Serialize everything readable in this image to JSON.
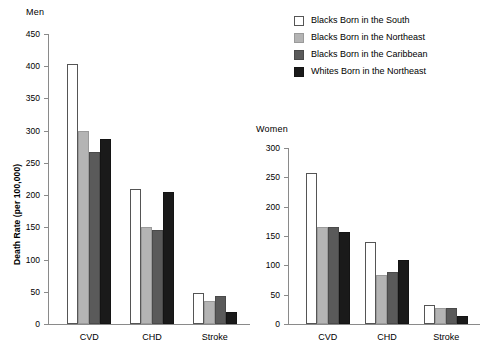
{
  "legend": {
    "position": "top-right",
    "items": [
      {
        "label": "Blacks Born in the South",
        "color": "#ffffff",
        "series_key": "blacks_south"
      },
      {
        "label": "Blacks Born in the Northeast",
        "color": "#b4b4b4",
        "series_key": "blacks_northeast"
      },
      {
        "label": "Blacks Born in the Caribbean",
        "color": "#5a5a5a",
        "series_key": "blacks_caribbean"
      },
      {
        "label": "Whites Born in the Northeast",
        "color": "#1a1a1a",
        "series_key": "whites_northeast"
      }
    ]
  },
  "chart_data": [
    {
      "type": "bar",
      "title": "Men",
      "xlabel": "",
      "ylabel": "Death Rate (per 100,000)",
      "categories": [
        "CVD",
        "CHD",
        "Stroke"
      ],
      "ylim": [
        0,
        450
      ],
      "yticks": [
        0,
        50,
        100,
        150,
        200,
        250,
        300,
        350,
        400,
        450
      ],
      "grid": false,
      "legend": "shared-top-right",
      "series": [
        {
          "name": "Blacks Born in the South",
          "color": "#ffffff",
          "values": [
            403,
            209,
            48
          ]
        },
        {
          "name": "Blacks Born in the Northeast",
          "color": "#b4b4b4",
          "values": [
            300,
            150,
            36
          ]
        },
        {
          "name": "Blacks Born in the Caribbean",
          "color": "#5a5a5a",
          "values": [
            267,
            146,
            44
          ]
        },
        {
          "name": "Whites Born in the Northeast",
          "color": "#1a1a1a",
          "values": [
            287,
            205,
            19
          ]
        }
      ]
    },
    {
      "type": "bar",
      "title": "Women",
      "xlabel": "",
      "ylabel": "",
      "categories": [
        "CVD",
        "CHD",
        "Stroke"
      ],
      "ylim": [
        0,
        300
      ],
      "yticks": [
        0,
        50,
        100,
        150,
        200,
        250,
        300
      ],
      "grid": false,
      "legend": "shared-top-right",
      "series": [
        {
          "name": "Blacks Born in the South",
          "color": "#ffffff",
          "values": [
            257,
            139,
            33
          ]
        },
        {
          "name": "Blacks Born in the Northeast",
          "color": "#b4b4b4",
          "values": [
            166,
            83,
            28
          ]
        },
        {
          "name": "Blacks Born in the Caribbean",
          "color": "#5a5a5a",
          "values": [
            166,
            88,
            27
          ]
        },
        {
          "name": "Whites Born in the Northeast",
          "color": "#1a1a1a",
          "values": [
            157,
            109,
            13
          ]
        }
      ]
    }
  ],
  "panels": {
    "men": {
      "x": 48,
      "y": 22,
      "w": 190,
      "h": 305,
      "plot_left": 48,
      "plot_top": 34,
      "plot_w": 188,
      "plot_h": 290
    },
    "women": {
      "x": 288,
      "y": 138,
      "w": 190,
      "h": 190,
      "plot_left": 288,
      "plot_top": 148,
      "plot_w": 178,
      "plot_h": 176
    }
  }
}
